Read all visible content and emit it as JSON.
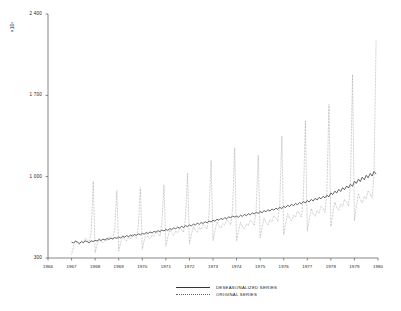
{
  "chart_data": {
    "type": "line",
    "title": "",
    "xlabel": "",
    "ylabel": "×10⁶",
    "ylim": [
      300,
      2400
    ],
    "yticks": [
      300,
      1000,
      1700,
      2400
    ],
    "ytick_labels": [
      "300",
      "1 000",
      "1 700",
      "2 400"
    ],
    "xlim": [
      1966,
      1980
    ],
    "xticks": [
      1966,
      1967,
      1968,
      1969,
      1970,
      1971,
      1972,
      1973,
      1974,
      1975,
      1976,
      1977,
      1978,
      1979,
      1980
    ],
    "xtick_labels": [
      "1966",
      "1967",
      "1968",
      "1969",
      "1970",
      "1971",
      "1972",
      "1973",
      "1974",
      "1975",
      "1976",
      "1977",
      "1978",
      "1979",
      "1980"
    ],
    "grid": false,
    "legend_position": "bottom-center",
    "series": [
      {
        "name": "DESEASONALIZED SERIES",
        "style": "solid",
        "color": "#333333",
        "x": [
          1967.0,
          1967.08,
          1967.17,
          1967.25,
          1967.33,
          1967.42,
          1967.5,
          1967.58,
          1967.67,
          1967.75,
          1967.83,
          1967.92,
          1968.0,
          1968.08,
          1968.17,
          1968.25,
          1968.33,
          1968.42,
          1968.5,
          1968.58,
          1968.67,
          1968.75,
          1968.83,
          1968.92,
          1969.0,
          1969.08,
          1969.17,
          1969.25,
          1969.33,
          1969.42,
          1969.5,
          1969.58,
          1969.67,
          1969.75,
          1969.83,
          1969.92,
          1970.0,
          1970.08,
          1970.17,
          1970.25,
          1970.33,
          1970.42,
          1970.5,
          1970.58,
          1970.67,
          1970.75,
          1970.83,
          1970.92,
          1971.0,
          1971.08,
          1971.17,
          1971.25,
          1971.33,
          1971.42,
          1971.5,
          1971.58,
          1971.67,
          1971.75,
          1971.83,
          1971.92,
          1972.0,
          1972.08,
          1972.17,
          1972.25,
          1972.33,
          1972.42,
          1972.5,
          1972.58,
          1972.67,
          1972.75,
          1972.83,
          1972.92,
          1973.0,
          1973.08,
          1973.17,
          1973.25,
          1973.33,
          1973.42,
          1973.5,
          1973.58,
          1973.67,
          1973.75,
          1973.83,
          1973.92,
          1974.0,
          1974.08,
          1974.17,
          1974.25,
          1974.33,
          1974.42,
          1974.5,
          1974.58,
          1974.67,
          1974.75,
          1974.83,
          1974.92,
          1975.0,
          1975.08,
          1975.17,
          1975.25,
          1975.33,
          1975.42,
          1975.5,
          1975.58,
          1975.67,
          1975.75,
          1975.83,
          1975.92,
          1976.0,
          1976.08,
          1976.17,
          1976.25,
          1976.33,
          1976.42,
          1976.5,
          1976.58,
          1976.67,
          1976.75,
          1976.83,
          1976.92,
          1977.0,
          1977.08,
          1977.17,
          1977.25,
          1977.33,
          1977.42,
          1977.5,
          1977.58,
          1977.67,
          1977.75,
          1977.83,
          1977.92,
          1978.0,
          1978.08,
          1978.17,
          1978.25,
          1978.33,
          1978.42,
          1978.5,
          1978.58,
          1978.67,
          1978.75,
          1978.83,
          1978.92,
          1979.0,
          1979.08,
          1979.17,
          1979.25,
          1979.33,
          1979.42,
          1979.5,
          1979.58,
          1979.67,
          1979.75,
          1979.83,
          1979.92
        ],
        "values": [
          437,
          430,
          444,
          436,
          425,
          440,
          433,
          447,
          441,
          430,
          448,
          442,
          452,
          446,
          459,
          450,
          462,
          455,
          468,
          460,
          472,
          464,
          476,
          470,
          480,
          473,
          487,
          479,
          492,
          484,
          497,
          489,
          502,
          495,
          508,
          500,
          512,
          505,
          519,
          511,
          524,
          516,
          529,
          522,
          535,
          527,
          540,
          533,
          546,
          538,
          553,
          545,
          559,
          551,
          566,
          558,
          572,
          563,
          578,
          570,
          585,
          576,
          592,
          583,
          599,
          590,
          606,
          597,
          612,
          603,
          618,
          610,
          626,
          616,
          634,
          624,
          641,
          631,
          648,
          638,
          655,
          645,
          662,
          652,
          660,
          650,
          668,
          658,
          675,
          664,
          682,
          671,
          688,
          678,
          695,
          684,
          700,
          690,
          708,
          698,
          715,
          704,
          722,
          712,
          729,
          718,
          736,
          726,
          745,
          734,
          754,
          742,
          762,
          750,
          770,
          758,
          778,
          766,
          786,
          774,
          795,
          782,
          804,
          791,
          813,
          800,
          822,
          809,
          831,
          818,
          840,
          827,
          860,
          846,
          875,
          860,
          890,
          873,
          905,
          888,
          920,
          902,
          935,
          917,
          960,
          942,
          978,
          958,
          995,
          973,
          1012,
          990,
          1028,
          1005,
          1045,
          1022
        ]
      },
      {
        "name": "ORIGINAL SERIES",
        "style": "dotted",
        "color": "#707070",
        "x": [
          1967.0,
          1967.08,
          1967.17,
          1967.25,
          1967.33,
          1967.42,
          1967.5,
          1967.58,
          1967.67,
          1967.75,
          1967.83,
          1967.92,
          1968.0,
          1968.08,
          1968.17,
          1968.25,
          1968.33,
          1968.42,
          1968.5,
          1968.58,
          1968.67,
          1968.75,
          1968.83,
          1968.92,
          1969.0,
          1969.08,
          1969.17,
          1969.25,
          1969.33,
          1969.42,
          1969.5,
          1969.58,
          1969.67,
          1969.75,
          1969.83,
          1969.92,
          1970.0,
          1970.08,
          1970.17,
          1970.25,
          1970.33,
          1970.42,
          1970.5,
          1970.58,
          1970.67,
          1970.75,
          1970.83,
          1970.92,
          1971.0,
          1971.08,
          1971.17,
          1971.25,
          1971.33,
          1971.42,
          1971.5,
          1971.58,
          1971.67,
          1971.75,
          1971.83,
          1971.92,
          1972.0,
          1972.08,
          1972.17,
          1972.25,
          1972.33,
          1972.42,
          1972.5,
          1972.58,
          1972.67,
          1972.75,
          1972.83,
          1972.92,
          1973.0,
          1973.08,
          1973.17,
          1973.25,
          1973.33,
          1973.42,
          1973.5,
          1973.58,
          1973.67,
          1973.75,
          1973.83,
          1973.92,
          1974.0,
          1974.08,
          1974.17,
          1974.25,
          1974.33,
          1974.42,
          1974.5,
          1974.58,
          1974.67,
          1974.75,
          1974.83,
          1974.92,
          1975.0,
          1975.08,
          1975.17,
          1975.25,
          1975.33,
          1975.42,
          1975.5,
          1975.58,
          1975.67,
          1975.75,
          1975.83,
          1975.92,
          1976.0,
          1976.08,
          1976.17,
          1976.25,
          1976.33,
          1976.42,
          1976.5,
          1976.58,
          1976.67,
          1976.75,
          1976.83,
          1976.92,
          1977.0,
          1977.08,
          1977.17,
          1977.25,
          1977.33,
          1977.42,
          1977.5,
          1977.58,
          1977.67,
          1977.75,
          1977.83,
          1977.92,
          1978.0,
          1978.08,
          1978.17,
          1978.25,
          1978.33,
          1978.42,
          1978.5,
          1978.58,
          1978.67,
          1978.75,
          1978.83,
          1978.92,
          1979.0,
          1979.08,
          1979.17,
          1979.25,
          1979.33,
          1979.42,
          1979.5,
          1979.58,
          1979.67,
          1979.75,
          1979.83,
          1979.92
        ],
        "values": [
          330,
          400,
          455,
          430,
          415,
          445,
          430,
          470,
          455,
          440,
          520,
          960,
          345,
          415,
          470,
          445,
          430,
          460,
          450,
          485,
          470,
          455,
          545,
          880,
          360,
          430,
          490,
          460,
          445,
          480,
          465,
          505,
          490,
          470,
          570,
          905,
          375,
          450,
          510,
          480,
          465,
          500,
          485,
          528,
          510,
          490,
          595,
          930,
          400,
          478,
          545,
          512,
          495,
          532,
          518,
          562,
          545,
          522,
          640,
          1030,
          420,
          500,
          572,
          538,
          520,
          560,
          545,
          590,
          572,
          548,
          672,
          1140,
          450,
          535,
          612,
          575,
          556,
          598,
          582,
          630,
          612,
          586,
          720,
          1250,
          448,
          530,
          608,
          572,
          552,
          595,
          578,
          626,
          608,
          582,
          716,
          1185,
          472,
          562,
          645,
          606,
          585,
          630,
          612,
          663,
          645,
          616,
          760,
          1350,
          500,
          595,
          683,
          642,
          620,
          668,
          650,
          703,
          683,
          653,
          806,
          1480,
          530,
          630,
          725,
          680,
          657,
          708,
          688,
          745,
          725,
          692,
          855,
          1620,
          570,
          680,
          782,
          735,
          710,
          764,
          743,
          804,
          782,
          747,
          925,
          1880,
          620,
          740,
          852,
          800,
          773,
          832,
          809,
          876,
          852,
          813,
          1010,
          2180
        ]
      }
    ]
  },
  "legend": {
    "items": [
      {
        "label": "DESEASONALIZED SERIES",
        "style": "solid"
      },
      {
        "label": "ORIGINAL SERIES",
        "style": "dotted"
      }
    ]
  }
}
